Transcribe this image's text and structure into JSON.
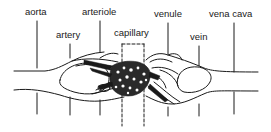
{
  "diagram": {
    "type": "anatomical-illustration",
    "labels": [
      {
        "id": "aorta",
        "text": "aorta"
      },
      {
        "id": "artery",
        "text": "artery"
      },
      {
        "id": "arteriole",
        "text": "arteriole"
      },
      {
        "id": "capillary",
        "text": "capillary"
      },
      {
        "id": "venule",
        "text": "venule"
      },
      {
        "id": "vein",
        "text": "vein"
      },
      {
        "id": "vena-cava",
        "text": "vena cava"
      }
    ],
    "colors": {
      "line": "#1a1a1a",
      "background": "#ffffff"
    }
  }
}
